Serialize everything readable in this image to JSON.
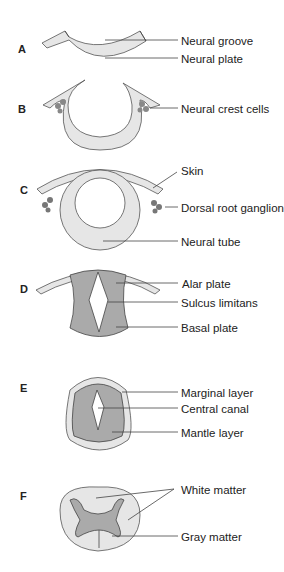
{
  "figure": {
    "panels": [
      {
        "letter": "A",
        "labels": [
          "Neural groove",
          "Neural plate"
        ]
      },
      {
        "letter": "B",
        "labels": [
          "Neural crest cells"
        ]
      },
      {
        "letter": "C",
        "labels": [
          "Skin",
          "Dorsal root ganglion",
          "Neural tube"
        ]
      },
      {
        "letter": "D",
        "labels": [
          "Alar plate",
          "Sulcus limitans",
          "Basal plate"
        ]
      },
      {
        "letter": "E",
        "labels": [
          "Marginal layer",
          "Central canal",
          "Mantle layer"
        ]
      },
      {
        "letter": "F",
        "labels": [
          "White matter",
          "Gray matter"
        ]
      }
    ]
  },
  "colors": {
    "light": "#e6e6e6",
    "mid": "#aaaaaa",
    "dark": "#6e6e6e",
    "stroke": "#555555"
  }
}
